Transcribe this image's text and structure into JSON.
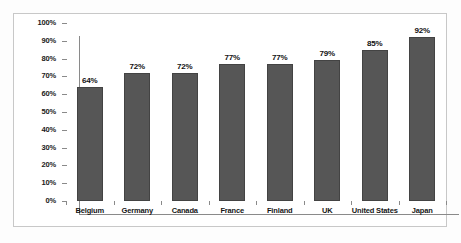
{
  "chart_data": {
    "type": "bar",
    "title": "",
    "subtitle": "",
    "xlabel": "",
    "ylabel": "",
    "categories": [
      "Belgium",
      "Germany",
      "Canada",
      "France",
      "Finland",
      "UK",
      "United States",
      "Japan"
    ],
    "values": [
      64,
      72,
      72,
      77,
      77,
      79,
      85,
      92
    ],
    "value_labels": [
      "64%",
      "72%",
      "72%",
      "77%",
      "77%",
      "79%",
      "85%",
      "92%"
    ],
    "ylim": [
      0,
      100
    ],
    "ytick_values": [
      100,
      90,
      80,
      70,
      60,
      50,
      40,
      30,
      20,
      10,
      0
    ],
    "ytick_labels": [
      "100%",
      "90%",
      "80%",
      "70%",
      "60%",
      "50%",
      "40%",
      "30%",
      "20%",
      "10%",
      "0%"
    ],
    "grid": false,
    "legend": false,
    "legend_position": "none",
    "series": [
      {
        "name": "",
        "values": [
          64,
          72,
          72,
          77,
          77,
          79,
          85,
          92
        ]
      }
    ],
    "colors": {
      "bar_fill": "#565656",
      "bar_border": "#434343",
      "axis": "#8a8a8a",
      "frame": "#c8c8c8",
      "background": "#ffffff",
      "text": "#111111"
    }
  }
}
